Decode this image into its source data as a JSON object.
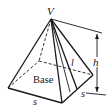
{
  "figure": {
    "labels": {
      "apex": "V",
      "base": "Base",
      "slant_height": "l",
      "height": "h",
      "side_front": "s",
      "side_right": "s"
    },
    "colors": {
      "stroke": "#1a1a1a",
      "background": "#ffffff"
    }
  }
}
